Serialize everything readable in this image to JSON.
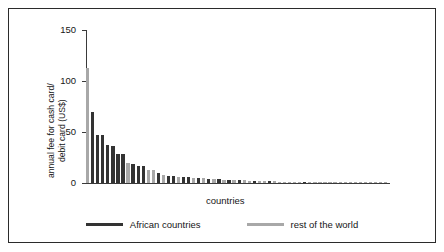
{
  "chart_data": {
    "type": "bar",
    "title": "",
    "subtitle": "",
    "xlabel": "countries",
    "ylabel": "annual fee for cash card/ debit card (US$)",
    "ylabel_line1": "annual fee for cash card/",
    "ylabel_line2": "debit card (US$)",
    "ylim": [
      0,
      150
    ],
    "yticks": [
      0,
      50,
      100,
      150
    ],
    "ytick_labels": [
      "0",
      "50",
      "100",
      "150"
    ],
    "grid": false,
    "legend_position": "bottom",
    "colors": {
      "african": "#333333",
      "rest_of_world": "#a8a8a8",
      "axis": "#3a3a3a",
      "frame": "#2b2b2b",
      "background": "#ffffff"
    },
    "legend": [
      {
        "name": "African countries",
        "color": "#333333"
      },
      {
        "name": "rest of the world",
        "color": "#a8a8a8"
      }
    ],
    "series": [
      {
        "name": "African countries",
        "color": "#333333"
      },
      {
        "name": "rest of the world",
        "color": "#a8a8a8"
      }
    ],
    "bars": [
      {
        "value": 113,
        "group": "rest of the world"
      },
      {
        "value": 70,
        "group": "African countries"
      },
      {
        "value": 47,
        "group": "African countries"
      },
      {
        "value": 47,
        "group": "African countries"
      },
      {
        "value": 37,
        "group": "African countries"
      },
      {
        "value": 36,
        "group": "African countries"
      },
      {
        "value": 28,
        "group": "African countries"
      },
      {
        "value": 28,
        "group": "African countries"
      },
      {
        "value": 20,
        "group": "rest of the world"
      },
      {
        "value": 19,
        "group": "African countries"
      },
      {
        "value": 17,
        "group": "African countries"
      },
      {
        "value": 17,
        "group": "African countries"
      },
      {
        "value": 13,
        "group": "rest of the world"
      },
      {
        "value": 13,
        "group": "rest of the world"
      },
      {
        "value": 10,
        "group": "African countries"
      },
      {
        "value": 8,
        "group": "rest of the world"
      },
      {
        "value": 7,
        "group": "African countries"
      },
      {
        "value": 7,
        "group": "African countries"
      },
      {
        "value": 6,
        "group": "rest of the world"
      },
      {
        "value": 6,
        "group": "African countries"
      },
      {
        "value": 6,
        "group": "African countries"
      },
      {
        "value": 5,
        "group": "rest of the world"
      },
      {
        "value": 5,
        "group": "African countries"
      },
      {
        "value": 5,
        "group": "rest of the world"
      },
      {
        "value": 4,
        "group": "African countries"
      },
      {
        "value": 4,
        "group": "rest of the world"
      },
      {
        "value": 4,
        "group": "African countries"
      },
      {
        "value": 3,
        "group": "rest of the world"
      },
      {
        "value": 3,
        "group": "African countries"
      },
      {
        "value": 3,
        "group": "rest of the world"
      },
      {
        "value": 2.5,
        "group": "African countries"
      },
      {
        "value": 2.5,
        "group": "rest of the world"
      },
      {
        "value": 2,
        "group": "rest of the world"
      },
      {
        "value": 2,
        "group": "African countries"
      },
      {
        "value": 2,
        "group": "rest of the world"
      },
      {
        "value": 1.8,
        "group": "rest of the world"
      },
      {
        "value": 1.6,
        "group": "African countries"
      },
      {
        "value": 1.5,
        "group": "rest of the world"
      },
      {
        "value": 1.4,
        "group": "rest of the world"
      },
      {
        "value": 1.3,
        "group": "rest of the world"
      },
      {
        "value": 1.2,
        "group": "rest of the world"
      },
      {
        "value": 1.1,
        "group": "rest of the world"
      },
      {
        "value": 1.0,
        "group": "rest of the world"
      },
      {
        "value": 1.0,
        "group": "African countries"
      },
      {
        "value": 0.9,
        "group": "rest of the world"
      },
      {
        "value": 0.9,
        "group": "rest of the world"
      },
      {
        "value": 0.8,
        "group": "rest of the world"
      },
      {
        "value": 0.8,
        "group": "rest of the world"
      },
      {
        "value": 0.7,
        "group": "rest of the world"
      },
      {
        "value": 0.7,
        "group": "rest of the world"
      },
      {
        "value": 0.6,
        "group": "rest of the world"
      },
      {
        "value": 0.6,
        "group": "rest of the world"
      },
      {
        "value": 0.5,
        "group": "rest of the world"
      },
      {
        "value": 0.5,
        "group": "rest of the world"
      },
      {
        "value": 0.5,
        "group": "rest of the world"
      },
      {
        "value": 0.4,
        "group": "rest of the world"
      },
      {
        "value": 0.4,
        "group": "rest of the world"
      },
      {
        "value": 0.4,
        "group": "rest of the world"
      },
      {
        "value": 0.3,
        "group": "rest of the world"
      },
      {
        "value": 0.3,
        "group": "rest of the world"
      }
    ]
  }
}
